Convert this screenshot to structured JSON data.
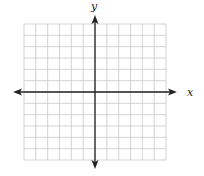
{
  "diagram": {
    "type": "coordinate-plane",
    "x_axis_label": "x",
    "y_axis_label": "y",
    "grid": {
      "columns": 12,
      "rows": 12,
      "left": 24,
      "top": 24,
      "right": 166,
      "bottom": 160,
      "line_color": "#c8c8c8"
    },
    "axes": {
      "color": "#222222",
      "origin_px": [
        95,
        92
      ],
      "x_arrow_left": 13,
      "x_arrow_right": 177,
      "y_arrow_top": 15,
      "y_arrow_bottom": 169
    }
  }
}
